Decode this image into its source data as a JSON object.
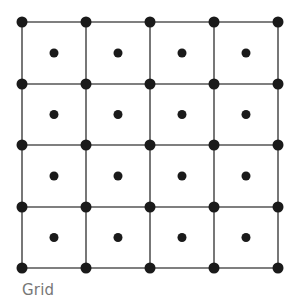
{
  "caption": "Grid",
  "grid": {
    "columns": 4,
    "rows": 4,
    "x_lines": [
      22,
      86,
      150,
      214,
      278
    ],
    "y_lines": [
      22,
      84,
      145,
      207,
      268
    ],
    "line_color": "#555555",
    "node_color": "#1a1a1a",
    "corner_node_radius": 5.5,
    "center_node_radius": 4.5
  }
}
